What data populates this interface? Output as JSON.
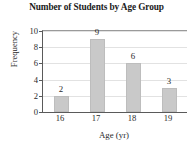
{
  "chart_data": {
    "type": "bar",
    "title": "Number of Students by Age Group",
    "xlabel": "Age (yr)",
    "ylabel": "Frequency",
    "categories": [
      "16",
      "17",
      "18",
      "19"
    ],
    "values": [
      2,
      9,
      6,
      3
    ],
    "value_labels": [
      "2",
      "9",
      "6",
      "3"
    ],
    "ylim": [
      0,
      10
    ],
    "yticks": [
      0,
      2,
      4,
      6,
      8,
      10
    ],
    "ytick_labels": [
      "0",
      "2",
      "4",
      "6",
      "8",
      "10"
    ],
    "grid": true,
    "grid_axis": "y",
    "legend": false,
    "bar_color": "#c9c9c9",
    "axis_color": "#5a5a5a",
    "grid_color": "#e2e2e2",
    "text_color": "#2a2a2a"
  }
}
